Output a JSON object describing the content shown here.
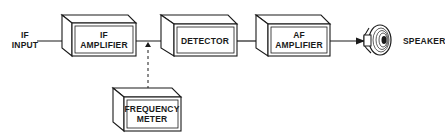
{
  "diagram": {
    "type": "block-diagram",
    "input": {
      "label_line1": "IF",
      "label_line2": "INPUT"
    },
    "blocks": [
      {
        "id": "if_amplifier",
        "line1": "IF",
        "line2": "AMPLIFIER"
      },
      {
        "id": "detector",
        "line1": "DETECTOR"
      },
      {
        "id": "af_amplifier",
        "line1": "AF",
        "line2": "AMPLIFIER"
      },
      {
        "id": "frequency_meter",
        "line1": "FREQUENCY",
        "line2": "METER"
      }
    ],
    "output": {
      "label": "SPEAKER"
    },
    "connections": [
      {
        "from": "IF INPUT",
        "to": "IF AMPLIFIER",
        "style": "solid-arrow"
      },
      {
        "from": "IF AMPLIFIER",
        "to": "DETECTOR",
        "style": "solid-arrow"
      },
      {
        "from": "FREQUENCY METER",
        "to": "IF AMPLIFIER-DETECTOR line",
        "style": "dashed"
      },
      {
        "from": "DETECTOR",
        "to": "AF AMPLIFIER",
        "style": "solid-arrow"
      },
      {
        "from": "AF AMPLIFIER",
        "to": "SPEAKER",
        "style": "solid-arrow"
      }
    ],
    "colors": {
      "ink": "#1a1a1a",
      "background": "#ffffff"
    }
  }
}
